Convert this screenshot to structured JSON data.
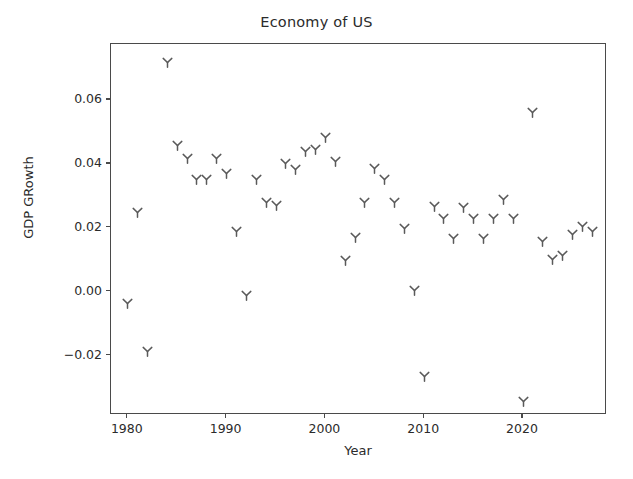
{
  "chart_data": {
    "type": "scatter",
    "title": "Economy of US",
    "xlabel": "Year",
    "ylabel": "GDP GRowth",
    "grid": false,
    "legend": null,
    "marker": "tri-down-y",
    "marker_color": "#5a5a5a",
    "xlim": [
      1978.3,
      1989.5
    ],
    "xlim_actual": [
      1978.3,
      2028.5
    ],
    "ylim": [
      -0.0385,
      0.0775
    ],
    "xticks": [
      1980,
      1990,
      2000,
      2010,
      2020
    ],
    "xticklabels": [
      "1980",
      "1990",
      "2000",
      "2010",
      "2020"
    ],
    "yticks": [
      -0.02,
      0.0,
      0.02,
      0.04,
      0.06
    ],
    "yticklabels": [
      "−0.02",
      "0.00",
      "0.02",
      "0.04",
      "0.06"
    ],
    "x": [
      1980,
      1981,
      1982,
      1984,
      1985,
      1986,
      1987,
      1988,
      1989,
      1990,
      1991,
      1992,
      1993,
      1994,
      1995,
      1996,
      1997,
      1998,
      1999,
      2000,
      2001,
      2002,
      2003,
      2004,
      2005,
      2006,
      2007,
      2008,
      2009,
      2010,
      2011,
      2012,
      2013,
      2014,
      2015,
      2016,
      2017,
      2018,
      2019,
      2020,
      2021,
      2022,
      2023,
      2024,
      2025,
      2026,
      2027
    ],
    "y": [
      -0.0035,
      0.0249,
      -0.0185,
      0.0718,
      0.0458,
      0.0417,
      0.0352,
      0.0352,
      0.0417,
      0.037,
      0.0189,
      -0.0011,
      0.0352,
      0.028,
      0.027,
      0.0402,
      0.0383,
      0.044,
      0.0444,
      0.0482,
      0.0409,
      0.0098,
      0.017,
      0.028,
      0.0387,
      0.0351,
      0.028,
      0.0199,
      0.0003,
      -0.0265,
      0.0268,
      0.0229,
      0.0168,
      0.0264,
      0.023,
      0.0168,
      0.0229,
      0.0289,
      0.0229,
      -0.0342,
      0.0561,
      0.0158,
      0.01,
      0.0113,
      0.0178,
      0.0204,
      0.0188
    ],
    "n_points": 47,
    "units": "fraction"
  },
  "axes": {
    "title": "Economy of US",
    "xlabel": "Year",
    "ylabel": "GDP GRowth"
  }
}
